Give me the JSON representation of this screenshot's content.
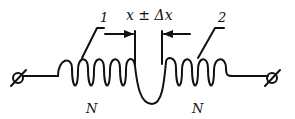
{
  "diagram": {
    "labels": {
      "coil1_number": "1",
      "coil2_number": "2",
      "gap": "x ± Δx",
      "coil1_turns": "N",
      "coil2_turns": "N"
    },
    "colors": {
      "ink": "#111111",
      "background": "#ffffff"
    }
  }
}
